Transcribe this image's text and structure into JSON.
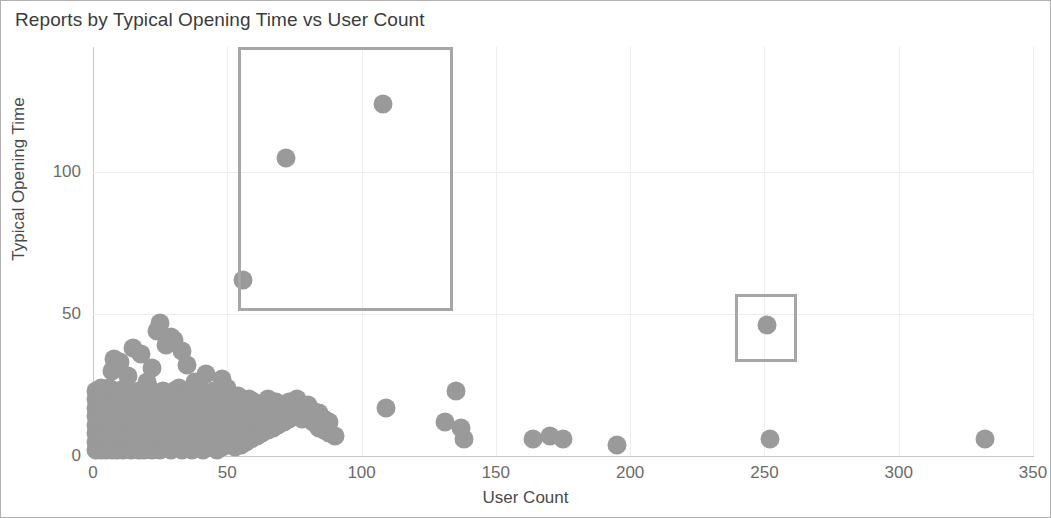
{
  "chart_data": {
    "type": "scatter",
    "title": "Reports by Typical Opening Time vs User Count",
    "xlabel": "User Count",
    "ylabel": "Typical Opening Time",
    "xlim": [
      0,
      350
    ],
    "ylim": [
      0,
      144
    ],
    "xticks": [
      0,
      50,
      100,
      150,
      200,
      250,
      300,
      350
    ],
    "yticks": [
      0,
      50,
      100
    ],
    "xtick_labels": [
      "0",
      "50",
      "100",
      "150",
      "200",
      "250",
      "300",
      "350"
    ],
    "ytick_labels": [
      "0",
      "50",
      "100"
    ],
    "grid": true,
    "legend": null,
    "marker_color": "#9a9a9a",
    "marker_size": 19,
    "points": [
      [
        1,
        2
      ],
      [
        1,
        5
      ],
      [
        1,
        8
      ],
      [
        1,
        11
      ],
      [
        1,
        14
      ],
      [
        1,
        17
      ],
      [
        1,
        20
      ],
      [
        1,
        23
      ],
      [
        2,
        3
      ],
      [
        2,
        6
      ],
      [
        2,
        9
      ],
      [
        2,
        13
      ],
      [
        2,
        16
      ],
      [
        2,
        19
      ],
      [
        2,
        22
      ],
      [
        3,
        2
      ],
      [
        3,
        5
      ],
      [
        3,
        8
      ],
      [
        3,
        12
      ],
      [
        3,
        15
      ],
      [
        3,
        18
      ],
      [
        3,
        21
      ],
      [
        3,
        24
      ],
      [
        4,
        3
      ],
      [
        4,
        7
      ],
      [
        4,
        10
      ],
      [
        4,
        14
      ],
      [
        4,
        17
      ],
      [
        4,
        20
      ],
      [
        4,
        23
      ],
      [
        5,
        2
      ],
      [
        5,
        5
      ],
      [
        5,
        9
      ],
      [
        5,
        12
      ],
      [
        5,
        16
      ],
      [
        5,
        19
      ],
      [
        5,
        22
      ],
      [
        6,
        3
      ],
      [
        6,
        6
      ],
      [
        6,
        10
      ],
      [
        6,
        13
      ],
      [
        6,
        17
      ],
      [
        6,
        20
      ],
      [
        6,
        24
      ],
      [
        7,
        2
      ],
      [
        7,
        5
      ],
      [
        7,
        8
      ],
      [
        7,
        12
      ],
      [
        7,
        15
      ],
      [
        7,
        19
      ],
      [
        7,
        22
      ],
      [
        7,
        30
      ],
      [
        8,
        3
      ],
      [
        8,
        7
      ],
      [
        8,
        11
      ],
      [
        8,
        14
      ],
      [
        8,
        18
      ],
      [
        8,
        21
      ],
      [
        8,
        34
      ],
      [
        9,
        2
      ],
      [
        9,
        6
      ],
      [
        9,
        9
      ],
      [
        9,
        13
      ],
      [
        9,
        16
      ],
      [
        9,
        20
      ],
      [
        9,
        23
      ],
      [
        10,
        3
      ],
      [
        10,
        8
      ],
      [
        10,
        12
      ],
      [
        10,
        15
      ],
      [
        10,
        19
      ],
      [
        10,
        22
      ],
      [
        10,
        33
      ],
      [
        11,
        2
      ],
      [
        11,
        5
      ],
      [
        11,
        10
      ],
      [
        11,
        14
      ],
      [
        11,
        17
      ],
      [
        11,
        21
      ],
      [
        12,
        4
      ],
      [
        12,
        7
      ],
      [
        12,
        11
      ],
      [
        12,
        15
      ],
      [
        12,
        18
      ],
      [
        12,
        24
      ],
      [
        13,
        3
      ],
      [
        13,
        6
      ],
      [
        13,
        9
      ],
      [
        13,
        13
      ],
      [
        13,
        17
      ],
      [
        13,
        20
      ],
      [
        13,
        28
      ],
      [
        14,
        2
      ],
      [
        14,
        5
      ],
      [
        14,
        10
      ],
      [
        14,
        14
      ],
      [
        14,
        18
      ],
      [
        14,
        22
      ],
      [
        15,
        3
      ],
      [
        15,
        7
      ],
      [
        15,
        12
      ],
      [
        15,
        16
      ],
      [
        15,
        19
      ],
      [
        15,
        38
      ],
      [
        16,
        4
      ],
      [
        16,
        8
      ],
      [
        16,
        11
      ],
      [
        16,
        15
      ],
      [
        16,
        21
      ],
      [
        17,
        2
      ],
      [
        17,
        6
      ],
      [
        17,
        10
      ],
      [
        17,
        14
      ],
      [
        17,
        18
      ],
      [
        17,
        23
      ],
      [
        18,
        3
      ],
      [
        18,
        7
      ],
      [
        18,
        12
      ],
      [
        18,
        16
      ],
      [
        18,
        20
      ],
      [
        18,
        36
      ],
      [
        19,
        2
      ],
      [
        19,
        5
      ],
      [
        19,
        9
      ],
      [
        19,
        13
      ],
      [
        19,
        17
      ],
      [
        19,
        22
      ],
      [
        20,
        4
      ],
      [
        20,
        8
      ],
      [
        20,
        11
      ],
      [
        20,
        15
      ],
      [
        20,
        19
      ],
      [
        20,
        26
      ],
      [
        21,
        3
      ],
      [
        21,
        6
      ],
      [
        21,
        10
      ],
      [
        21,
        14
      ],
      [
        21,
        18
      ],
      [
        21,
        24
      ],
      [
        22,
        2
      ],
      [
        22,
        7
      ],
      [
        22,
        12
      ],
      [
        22,
        16
      ],
      [
        22,
        20
      ],
      [
        22,
        31
      ],
      [
        23,
        4
      ],
      [
        23,
        9
      ],
      [
        23,
        13
      ],
      [
        23,
        17
      ],
      [
        23,
        22
      ],
      [
        24,
        3
      ],
      [
        24,
        6
      ],
      [
        24,
        11
      ],
      [
        24,
        15
      ],
      [
        24,
        19
      ],
      [
        24,
        44
      ],
      [
        25,
        2
      ],
      [
        25,
        8
      ],
      [
        25,
        12
      ],
      [
        25,
        16
      ],
      [
        25,
        21
      ],
      [
        25,
        47
      ],
      [
        26,
        5
      ],
      [
        26,
        10
      ],
      [
        26,
        14
      ],
      [
        26,
        18
      ],
      [
        26,
        23
      ],
      [
        27,
        3
      ],
      [
        27,
        7
      ],
      [
        27,
        11
      ],
      [
        27,
        16
      ],
      [
        27,
        20
      ],
      [
        27,
        39
      ],
      [
        28,
        4
      ],
      [
        28,
        9
      ],
      [
        28,
        13
      ],
      [
        28,
        17
      ],
      [
        28,
        22
      ],
      [
        29,
        2
      ],
      [
        29,
        6
      ],
      [
        29,
        12
      ],
      [
        29,
        15
      ],
      [
        29,
        19
      ],
      [
        29,
        42
      ],
      [
        30,
        5
      ],
      [
        30,
        8
      ],
      [
        30,
        14
      ],
      [
        30,
        18
      ],
      [
        30,
        23
      ],
      [
        30,
        41
      ],
      [
        31,
        3
      ],
      [
        31,
        7
      ],
      [
        31,
        11
      ],
      [
        31,
        16
      ],
      [
        31,
        20
      ],
      [
        32,
        4
      ],
      [
        32,
        9
      ],
      [
        32,
        13
      ],
      [
        32,
        17
      ],
      [
        32,
        24
      ],
      [
        33,
        2
      ],
      [
        33,
        6
      ],
      [
        33,
        10
      ],
      [
        33,
        15
      ],
      [
        33,
        19
      ],
      [
        33,
        37
      ],
      [
        34,
        5
      ],
      [
        34,
        8
      ],
      [
        34,
        12
      ],
      [
        34,
        18
      ],
      [
        34,
        22
      ],
      [
        35,
        3
      ],
      [
        35,
        7
      ],
      [
        35,
        14
      ],
      [
        35,
        17
      ],
      [
        35,
        21
      ],
      [
        35,
        32
      ],
      [
        36,
        4
      ],
      [
        36,
        9
      ],
      [
        36,
        11
      ],
      [
        36,
        16
      ],
      [
        36,
        20
      ],
      [
        37,
        2
      ],
      [
        37,
        6
      ],
      [
        37,
        13
      ],
      [
        37,
        18
      ],
      [
        37,
        23
      ],
      [
        38,
        5
      ],
      [
        38,
        10
      ],
      [
        38,
        15
      ],
      [
        38,
        19
      ],
      [
        38,
        26
      ],
      [
        39,
        3
      ],
      [
        39,
        8
      ],
      [
        39,
        12
      ],
      [
        39,
        17
      ],
      [
        39,
        21
      ],
      [
        40,
        4
      ],
      [
        40,
        7
      ],
      [
        40,
        14
      ],
      [
        40,
        18
      ],
      [
        40,
        24
      ],
      [
        41,
        2
      ],
      [
        41,
        9
      ],
      [
        41,
        13
      ],
      [
        41,
        16
      ],
      [
        41,
        20
      ],
      [
        42,
        5
      ],
      [
        42,
        11
      ],
      [
        42,
        15
      ],
      [
        42,
        19
      ],
      [
        42,
        29
      ],
      [
        43,
        3
      ],
      [
        43,
        8
      ],
      [
        43,
        12
      ],
      [
        43,
        17
      ],
      [
        43,
        22
      ],
      [
        44,
        6
      ],
      [
        44,
        10
      ],
      [
        44,
        14
      ],
      [
        44,
        18
      ],
      [
        45,
        4
      ],
      [
        45,
        9
      ],
      [
        45,
        13
      ],
      [
        45,
        19
      ],
      [
        45,
        23
      ],
      [
        46,
        2
      ],
      [
        46,
        7
      ],
      [
        46,
        12
      ],
      [
        46,
        16
      ],
      [
        46,
        21
      ],
      [
        47,
        5
      ],
      [
        47,
        10
      ],
      [
        47,
        15
      ],
      [
        47,
        20
      ],
      [
        48,
        3
      ],
      [
        48,
        8
      ],
      [
        48,
        13
      ],
      [
        48,
        18
      ],
      [
        48,
        27
      ],
      [
        49,
        6
      ],
      [
        49,
        11
      ],
      [
        49,
        16
      ],
      [
        49,
        22
      ],
      [
        50,
        4
      ],
      [
        50,
        9
      ],
      [
        50,
        14
      ],
      [
        50,
        19
      ],
      [
        50,
        24
      ],
      [
        51,
        7
      ],
      [
        51,
        12
      ],
      [
        51,
        17
      ],
      [
        52,
        5
      ],
      [
        52,
        10
      ],
      [
        52,
        15
      ],
      [
        52,
        20
      ],
      [
        53,
        3
      ],
      [
        53,
        8
      ],
      [
        53,
        13
      ],
      [
        53,
        18
      ],
      [
        54,
        6
      ],
      [
        54,
        11
      ],
      [
        54,
        16
      ],
      [
        54,
        21
      ],
      [
        55,
        4
      ],
      [
        55,
        9
      ],
      [
        55,
        14
      ],
      [
        55,
        19
      ],
      [
        56,
        7
      ],
      [
        56,
        12
      ],
      [
        56,
        62
      ],
      [
        57,
        5
      ],
      [
        57,
        10
      ],
      [
        57,
        17
      ],
      [
        58,
        8
      ],
      [
        58,
        13
      ],
      [
        58,
        20
      ],
      [
        59,
        6
      ],
      [
        59,
        11
      ],
      [
        59,
        16
      ],
      [
        60,
        9
      ],
      [
        60,
        14
      ],
      [
        60,
        19
      ],
      [
        61,
        7
      ],
      [
        61,
        12
      ],
      [
        62,
        10
      ],
      [
        62,
        15
      ],
      [
        63,
        8
      ],
      [
        63,
        13
      ],
      [
        63,
        18
      ],
      [
        64,
        11
      ],
      [
        64,
        16
      ],
      [
        65,
        9
      ],
      [
        65,
        14
      ],
      [
        65,
        20
      ],
      [
        66,
        12
      ],
      [
        66,
        17
      ],
      [
        67,
        10
      ],
      [
        67,
        15
      ],
      [
        68,
        13
      ],
      [
        68,
        19
      ],
      [
        69,
        11
      ],
      [
        69,
        16
      ],
      [
        70,
        14
      ],
      [
        70,
        18
      ],
      [
        71,
        12
      ],
      [
        71,
        17
      ],
      [
        72,
        15
      ],
      [
        72,
        105
      ],
      [
        73,
        13
      ],
      [
        73,
        19
      ],
      [
        74,
        16
      ],
      [
        75,
        14
      ],
      [
        75,
        18
      ],
      [
        76,
        15
      ],
      [
        76,
        20
      ],
      [
        78,
        13
      ],
      [
        78,
        17
      ],
      [
        80,
        14
      ],
      [
        80,
        18
      ],
      [
        82,
        12
      ],
      [
        82,
        16
      ],
      [
        84,
        10
      ],
      [
        84,
        15
      ],
      [
        86,
        9
      ],
      [
        86,
        13
      ],
      [
        88,
        8
      ],
      [
        88,
        12
      ],
      [
        90,
        7
      ],
      [
        108,
        124
      ],
      [
        109,
        17
      ],
      [
        131,
        12
      ],
      [
        135,
        23
      ],
      [
        137,
        10
      ],
      [
        138,
        6
      ],
      [
        164,
        6
      ],
      [
        170,
        7
      ],
      [
        175,
        6
      ],
      [
        195,
        4
      ],
      [
        251,
        46
      ],
      [
        252,
        6
      ],
      [
        332,
        6
      ]
    ],
    "selection_boxes": [
      {
        "x0": 54,
        "y0": 51,
        "x1": 134,
        "y1": 144,
        "label": "large-outlier-selection"
      },
      {
        "x0": 239,
        "y0": 33,
        "x1": 262,
        "y1": 57,
        "label": "small-outlier-selection"
      }
    ],
    "selection_border_color": "#a6a6a6"
  }
}
